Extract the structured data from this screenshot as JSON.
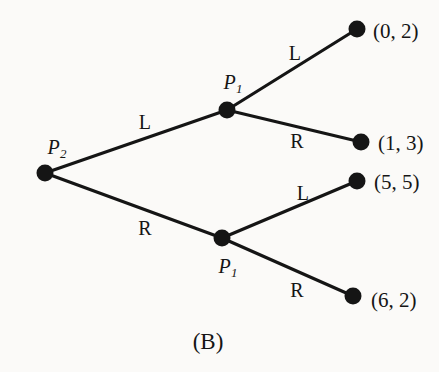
{
  "figure": {
    "caption": "(B)",
    "background_color": "#fbfaf8",
    "ink_color": "#151515"
  },
  "tree": {
    "nodes": [
      {
        "id": "root",
        "name": "decision-node-p2",
        "label": "P",
        "subscript": "2",
        "x": 45,
        "y": 173,
        "r": 8.5,
        "label_x": 57,
        "label_y": 149
      },
      {
        "id": "upper",
        "name": "decision-node-p1-upper",
        "label": "P",
        "subscript": "1",
        "x": 227,
        "y": 110,
        "r": 8.5,
        "label_x": 233,
        "label_y": 84
      },
      {
        "id": "lower",
        "name": "decision-node-p1-lower",
        "label": "P",
        "subscript": "1",
        "x": 222,
        "y": 238,
        "r": 8.5,
        "label_x": 228,
        "label_y": 268
      }
    ],
    "terminals": [
      {
        "id": "t1",
        "name": "terminal-node-0-2",
        "payoff": "(0, 2)",
        "x": 357,
        "y": 29,
        "r": 8.5,
        "text_x": 373,
        "text_y": 31
      },
      {
        "id": "t2",
        "name": "terminal-node-1-3",
        "payoff": "(1, 3)",
        "x": 361,
        "y": 142,
        "r": 8.5,
        "text_x": 378,
        "text_y": 143
      },
      {
        "id": "t3",
        "name": "terminal-node-5-5",
        "payoff": "(5, 5)",
        "x": 357,
        "y": 181,
        "r": 8.5,
        "text_x": 374,
        "text_y": 182
      },
      {
        "id": "t4",
        "name": "terminal-node-6-2",
        "payoff": "(6, 2)",
        "x": 353,
        "y": 296,
        "r": 8.5,
        "text_x": 371,
        "text_y": 300
      }
    ],
    "edges": [
      {
        "id": "e1",
        "name": "edge-p2-left",
        "from": "root",
        "to": "upper",
        "action": "L",
        "label_x": 145,
        "label_y": 122
      },
      {
        "id": "e2",
        "name": "edge-p2-right",
        "from": "root",
        "to": "lower",
        "action": "R",
        "label_x": 145,
        "label_y": 228
      },
      {
        "id": "e3",
        "name": "edge-p1-upper-left",
        "from": "upper",
        "to": "t1",
        "action": "L",
        "label_x": 295,
        "label_y": 53
      },
      {
        "id": "e4",
        "name": "edge-p1-upper-right",
        "from": "upper",
        "to": "t2",
        "action": "R",
        "label_x": 297,
        "label_y": 141
      },
      {
        "id": "e5",
        "name": "edge-p1-lower-left",
        "from": "lower",
        "to": "t3",
        "action": "L",
        "label_x": 303,
        "label_y": 193
      },
      {
        "id": "e6",
        "name": "edge-p1-lower-right",
        "from": "lower",
        "to": "t4",
        "action": "R",
        "label_x": 297,
        "label_y": 290
      }
    ],
    "edge_width": 3.2
  },
  "caption": {
    "text": "(B)",
    "x": 208,
    "y": 341
  }
}
